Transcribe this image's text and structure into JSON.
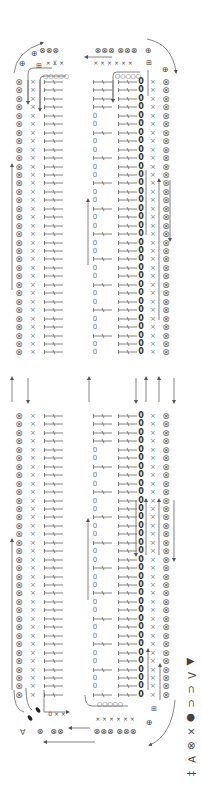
{
  "diagram": {
    "type": "crochet-stitch-chart",
    "orientation": "rotated-90",
    "columns": {
      "outer_left": "crossed-circle",
      "left_sc": "x",
      "left_dc": "dc",
      "mid_left": "dc-or-chain",
      "mid_right": "dc",
      "bold_chain": "bold-0",
      "right_sc": "x",
      "outer_right": "crossed-circle"
    },
    "mid_left_pattern": [
      "dc",
      "0",
      "0"
    ],
    "top_block": {
      "y_start": 82,
      "rows": 33
    },
    "bottom_block": {
      "y_start": 416,
      "rows": 34
    },
    "row_spacing": 8.45,
    "top_labels": {
      "left_group": "⊗⊗⊗",
      "left_plus": "⊕",
      "left_plus2": "⊕",
      "left_inc": "⊞",
      "left_x": "× ⊻ ×",
      "left_chain": "○○○○○",
      "mid_group": "⊗⊗⊗ ⊗⊗⊗",
      "mid_x": "× × ×  × × ×",
      "right_plus": "⊕",
      "right_plus2": "⊕",
      "right_inc": "⊞",
      "mid_chain": "○○○○○",
      "mid_bold": "0"
    },
    "bottom_labels": {
      "left_group": "⊗⊗",
      "left_plus": "⊗",
      "mid_group": "⊗⊗⊗ ⊗⊗⊗",
      "mid_x": "× × ×  × × ×",
      "left_x": "0 × ×",
      "mid_chain": "○○○○○",
      "right_plus": "⊕",
      "right_inc": "⊞"
    }
  },
  "legend": {
    "items": [
      {
        "symbol": "▲",
        "name": "filled-triangle"
      },
      {
        "symbol": "Λ",
        "name": "decrease"
      },
      {
        "symbol": "⊂",
        "name": "chain"
      },
      {
        "symbol": "⊂",
        "name": "bold-chain"
      },
      {
        "symbol": "●",
        "name": "slip-stitch"
      },
      {
        "symbol": "×",
        "name": "single-crochet"
      },
      {
        "symbol": "⊗",
        "name": "crossed-circle"
      },
      {
        "symbol": "∀",
        "name": "increase"
      },
      {
        "symbol": "‡",
        "name": "double-crochet"
      }
    ]
  }
}
